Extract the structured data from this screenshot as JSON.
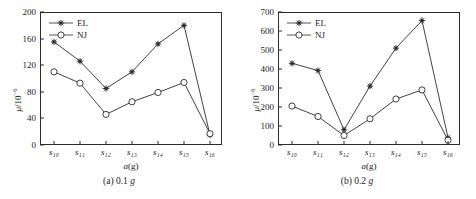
{
  "figure": {
    "panels": [
      {
        "caption_prefix": "(a) 0.1 ",
        "caption_unit": "g",
        "xlabel_var": "a",
        "xlabel_unit": "(g)",
        "ylabel_var": "μ",
        "ylabel_unit": "/10",
        "ylabel_exp": "−6",
        "legend": [
          {
            "label": "EL",
            "marker": "filled-star"
          },
          {
            "label": "NJ",
            "marker": "open-circle"
          }
        ]
      },
      {
        "caption_prefix": "(b) 0.2 ",
        "caption_unit": "g",
        "xlabel_var": "a",
        "xlabel_unit": "(g)",
        "ylabel_var": "μ",
        "ylabel_unit": "/10",
        "ylabel_exp": "−6",
        "legend": [
          {
            "label": "EL",
            "marker": "filled-star"
          },
          {
            "label": "NJ",
            "marker": "open-circle"
          }
        ]
      }
    ]
  },
  "chart_data": [
    {
      "type": "line",
      "title": "(a) 0.1 g",
      "xlabel": "a(g)",
      "ylabel": "μ/10⁻⁶",
      "categories": [
        "s10",
        "s11",
        "s12",
        "s13",
        "s14",
        "s15",
        "s16"
      ],
      "tick_labels": [
        "s₁₀",
        "s₁₁",
        "s₁₂",
        "s₁₃",
        "s₁₄",
        "s₁₅",
        "s₁₆"
      ],
      "ylim": [
        0,
        200
      ],
      "yticks": [
        0,
        40,
        80,
        120,
        160,
        200
      ],
      "grid": false,
      "legend_position": "top-left",
      "series": [
        {
          "name": "EL",
          "marker": "filled-star",
          "values": [
            155,
            126,
            85,
            110,
            152,
            180,
            15
          ]
        },
        {
          "name": "NJ",
          "marker": "open-circle",
          "values": [
            110,
            93,
            46,
            65,
            79,
            94,
            17
          ]
        }
      ]
    },
    {
      "type": "line",
      "title": "(b) 0.2 g",
      "xlabel": "a(g)",
      "ylabel": "μ/10⁻⁶",
      "categories": [
        "s10",
        "s11",
        "s12",
        "s13",
        "s14",
        "s15",
        "s16"
      ],
      "tick_labels": [
        "s₁₀",
        "s₁₁",
        "s₁₂",
        "s₁₃",
        "s₁₄",
        "s₁₅",
        "s₁₆"
      ],
      "ylim": [
        0,
        700
      ],
      "yticks": [
        0,
        100,
        200,
        300,
        400,
        500,
        600,
        700
      ],
      "grid": false,
      "legend_position": "top-left",
      "series": [
        {
          "name": "EL",
          "marker": "filled-star",
          "values": [
            430,
            392,
            80,
            310,
            510,
            655,
            38
          ]
        },
        {
          "name": "NJ",
          "marker": "open-circle",
          "values": [
            205,
            150,
            50,
            138,
            242,
            290,
            25
          ]
        }
      ]
    }
  ],
  "colors": {
    "axis": "#2b2b2b",
    "series_el": "#2b2b2b",
    "series_nj": "#2b2b2b",
    "background": "#ffffff"
  }
}
